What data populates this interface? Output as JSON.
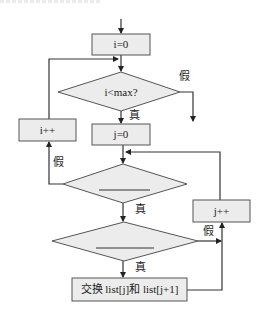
{
  "diagram": {
    "type": "flowchart",
    "colors": {
      "stroke": "#333333",
      "fill": "#ececec",
      "text": "#222222"
    },
    "nodes": {
      "init_i": {
        "shape": "rect",
        "label": "i=0"
      },
      "cond_i": {
        "shape": "diamond",
        "label": "i<max?"
      },
      "inc_i": {
        "shape": "rect",
        "label": "i++"
      },
      "init_j": {
        "shape": "rect",
        "label": "j=0"
      },
      "cond_j": {
        "shape": "diamond",
        "label": "____"
      },
      "cond_cmp": {
        "shape": "diamond",
        "label": "____"
      },
      "inc_j": {
        "shape": "rect",
        "label": "j++"
      },
      "swap": {
        "shape": "rect",
        "label": "交换 list[j]和 list[j+1]"
      }
    },
    "edge_labels": {
      "cond_i_true": "真",
      "cond_i_false": "假",
      "cond_j_true": "真",
      "cond_j_false": "假",
      "cond_cmp_true": "真",
      "cond_cmp_false": "假"
    },
    "edges": [
      {
        "from": "start",
        "to": "init_i"
      },
      {
        "from": "init_i",
        "to": "cond_i"
      },
      {
        "from": "cond_i",
        "to": "init_j",
        "label": "真"
      },
      {
        "from": "cond_i",
        "to": "end",
        "label": "假"
      },
      {
        "from": "init_j",
        "to": "cond_j"
      },
      {
        "from": "cond_j",
        "to": "cond_cmp",
        "label": "真"
      },
      {
        "from": "cond_j",
        "to": "inc_i",
        "label": "假"
      },
      {
        "from": "inc_i",
        "to": "cond_i"
      },
      {
        "from": "cond_cmp",
        "to": "swap",
        "label": "真"
      },
      {
        "from": "cond_cmp",
        "to": "inc_j",
        "label": "假"
      },
      {
        "from": "swap",
        "to": "inc_j"
      },
      {
        "from": "inc_j",
        "to": "cond_j"
      }
    ]
  }
}
